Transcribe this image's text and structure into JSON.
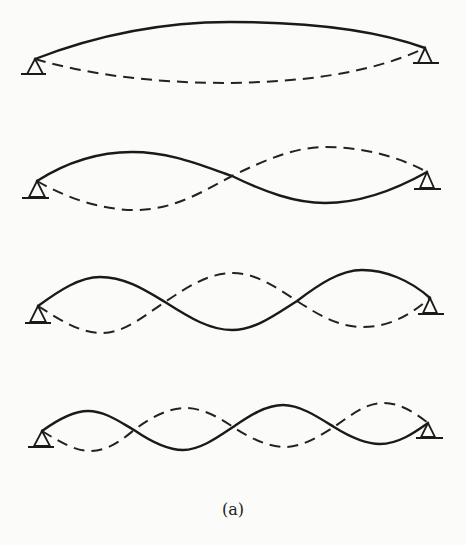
{
  "figure": {
    "caption": "(a)",
    "colors": {
      "background": "#fbfbfa",
      "line": "#1a1a1a"
    },
    "modes": [
      {
        "mode": 1,
        "half_waves": 1,
        "left_support": [
          35,
          59
        ],
        "right_support": [
          425,
          48
        ]
      },
      {
        "mode": 2,
        "half_waves": 2,
        "left_support": [
          37,
          181
        ],
        "right_support": [
          427,
          172
        ]
      },
      {
        "mode": 3,
        "half_waves": 3,
        "left_support": [
          38,
          306
        ],
        "right_support": [
          430,
          298
        ]
      },
      {
        "mode": 4,
        "half_waves": 4,
        "left_support": [
          42,
          431
        ],
        "right_support": [
          428,
          423
        ]
      }
    ],
    "line_styles": {
      "solid": "deflected shape",
      "dashed": "opposite phase shape"
    }
  }
}
